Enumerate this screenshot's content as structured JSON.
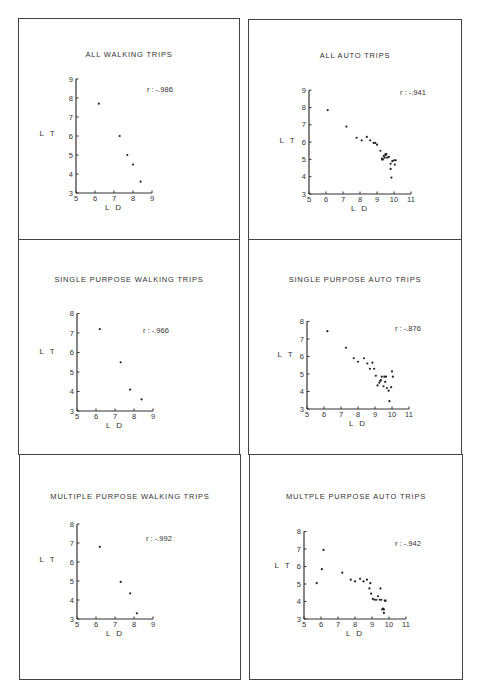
{
  "figure": {
    "panels": [
      {
        "id": "p1",
        "title": "ALL WALKING TRIPS",
        "r_label": "r : -.986"
      },
      {
        "id": "p2",
        "title": "ALL AUTO TRIPS",
        "r_label": "r : -.941"
      },
      {
        "id": "p3",
        "title": "SINGLE PURPOSE WALKING TRIPS",
        "r_label": "r : -.966"
      },
      {
        "id": "p4",
        "title": "SINGLE PURPOSE AUTO TRIPS",
        "r_label": "r : -.876"
      },
      {
        "id": "p5",
        "title": "MULTIPLE PURPOSE WALKING TRIPS",
        "r_label": "r : -.992"
      },
      {
        "id": "p6",
        "title": "MULTPLE PURPOSE AUTO TRIPS",
        "r_label": "r : -.942"
      }
    ],
    "caption": "Figure ... (caption cut off)"
  },
  "chart_data": [
    {
      "type": "scatter",
      "title": "ALL WALKING TRIPS",
      "xlabel": "L D",
      "ylabel": "L T",
      "xlim": [
        5,
        9
      ],
      "ylim": [
        3,
        9
      ],
      "xticks": [
        5,
        6,
        7,
        8,
        9
      ],
      "yticks": [
        3,
        4,
        5,
        6,
        7,
        8,
        9
      ],
      "annotation": "r : -.986",
      "x": [
        6.2,
        7.3,
        7.7,
        8.0,
        8.4
      ],
      "y": [
        7.7,
        6.0,
        5.0,
        4.5,
        3.6
      ]
    },
    {
      "type": "scatter",
      "title": "ALL AUTO TRIPS",
      "xlabel": "L D",
      "ylabel": "L T",
      "xlim": [
        5,
        11
      ],
      "ylim": [
        3,
        9
      ],
      "xticks": [
        5,
        6,
        7,
        8,
        9,
        10,
        11
      ],
      "yticks": [
        3,
        4,
        5,
        6,
        7,
        8,
        9
      ],
      "annotation": "r : -.941",
      "x": [
        6.1,
        7.2,
        7.8,
        8.1,
        8.4,
        8.6,
        8.8,
        8.9,
        9.0,
        9.2,
        9.3,
        9.35,
        9.4,
        9.5,
        9.5,
        9.6,
        9.7,
        9.8,
        9.8,
        9.85,
        9.9,
        10.0,
        10.05,
        10.1,
        9.3,
        9.45,
        9.55
      ],
      "y": [
        7.85,
        6.9,
        6.25,
        6.1,
        6.3,
        6.1,
        5.95,
        5.95,
        5.85,
        5.5,
        5.0,
        5.0,
        5.2,
        5.25,
        5.3,
        5.1,
        5.15,
        4.75,
        4.45,
        3.95,
        4.9,
        4.95,
        4.7,
        4.95,
        5.05,
        5.1,
        5.3
      ]
    },
    {
      "type": "scatter",
      "title": "SINGLE PURPOSE WALKING TRIPS",
      "xlabel": "L D",
      "ylabel": "L T",
      "xlim": [
        5,
        9
      ],
      "ylim": [
        3,
        8
      ],
      "xticks": [
        5,
        6,
        7,
        8,
        9
      ],
      "yticks": [
        3,
        4,
        5,
        6,
        7,
        8
      ],
      "annotation": "r : -.966",
      "x": [
        6.2,
        7.3,
        7.8,
        8.4
      ],
      "y": [
        7.2,
        5.5,
        4.1,
        3.6
      ]
    },
    {
      "type": "scatter",
      "title": "SINGLE PURPOSE AUTO TRIPS",
      "xlabel": "L D",
      "ylabel": "L T",
      "xlim": [
        5,
        11
      ],
      "ylim": [
        3,
        8
      ],
      "xticks": [
        5,
        6,
        7,
        8,
        9,
        10,
        11
      ],
      "yticks": [
        3,
        4,
        5,
        6,
        7,
        8
      ],
      "annotation": "r : -.876",
      "x": [
        6.2,
        7.3,
        7.75,
        8.0,
        8.35,
        8.55,
        8.7,
        8.85,
        8.95,
        9.05,
        9.15,
        9.25,
        9.3,
        9.35,
        9.4,
        9.5,
        9.55,
        9.6,
        9.65,
        9.7,
        9.8,
        9.85,
        9.95,
        10.0,
        10.05
      ],
      "y": [
        7.45,
        6.5,
        5.9,
        5.7,
        5.9,
        5.6,
        5.3,
        5.65,
        5.3,
        4.9,
        4.35,
        4.5,
        4.6,
        4.65,
        4.85,
        4.3,
        4.85,
        4.55,
        4.85,
        4.2,
        4.05,
        3.45,
        4.25,
        5.15,
        4.85
      ]
    },
    {
      "type": "scatter",
      "title": "MULTIPLE PURPOSE WALKING TRIPS",
      "xlabel": "L D",
      "ylabel": "L T",
      "xlim": [
        5,
        9
      ],
      "ylim": [
        3,
        8
      ],
      "xticks": [
        5,
        6,
        7,
        8,
        9
      ],
      "yticks": [
        3,
        4,
        5,
        6,
        7,
        8
      ],
      "annotation": "r : -.992",
      "x": [
        6.2,
        7.3,
        7.8,
        8.15
      ],
      "y": [
        6.8,
        4.95,
        4.35,
        3.3
      ]
    },
    {
      "type": "scatter",
      "title": "MULTPLE PURPOSE AUTO TRIPS",
      "xlabel": "L D",
      "ylabel": "L T",
      "xlim": [
        5,
        11
      ],
      "ylim": [
        3,
        8
      ],
      "xticks": [
        5,
        6,
        7,
        8,
        9,
        10,
        11
      ],
      "yticks": [
        3,
        4,
        5,
        6,
        7,
        8
      ],
      "annotation": "r : -.942",
      "x": [
        5.75,
        6.05,
        6.15,
        7.25,
        7.75,
        8.0,
        8.3,
        8.5,
        8.7,
        8.85,
        8.9,
        8.95,
        9.05,
        9.15,
        9.25,
        9.35,
        9.45,
        9.5,
        9.55,
        9.6,
        9.65,
        9.7,
        9.7,
        9.75,
        9.8
      ],
      "y": [
        5.05,
        5.85,
        6.95,
        5.65,
        5.25,
        5.15,
        5.3,
        5.15,
        5.25,
        4.75,
        5.05,
        4.45,
        4.15,
        4.1,
        4.1,
        4.3,
        4.1,
        4.75,
        4.1,
        3.55,
        3.6,
        3.55,
        3.35,
        4.05,
        4.05
      ]
    }
  ]
}
